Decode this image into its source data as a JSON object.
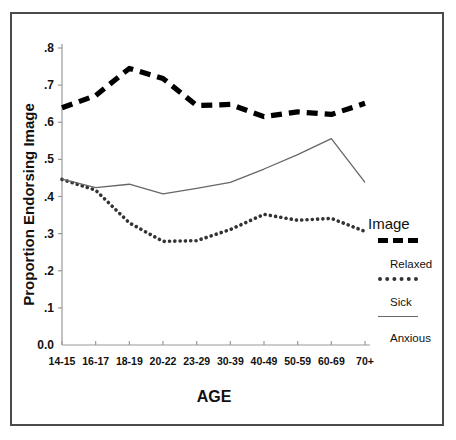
{
  "chart_data": {
    "type": "line",
    "title": "",
    "xlabel": "AGE",
    "ylabel": "Proportion Endorsing Image",
    "categories": [
      "14-15",
      "16-17",
      "18-19",
      "20-22",
      "23-29",
      "30-39",
      "40-49",
      "50-59",
      "60-69",
      "70+"
    ],
    "ylim": [
      0.0,
      0.8
    ],
    "ytick_labels": [
      "0.0",
      ".1",
      ".2",
      ".3",
      ".4",
      ".5",
      ".6",
      ".7",
      ".8"
    ],
    "ytick_values": [
      0.0,
      0.1,
      0.2,
      0.3,
      0.4,
      0.5,
      0.6,
      0.7,
      0.8
    ],
    "grid": false,
    "legend_position": "right",
    "legend_title": "Image",
    "series": [
      {
        "name": "Relaxed",
        "style": "thick-dashed",
        "color": "#000000",
        "values": [
          0.639,
          0.672,
          0.745,
          0.718,
          0.645,
          0.648,
          0.615,
          0.628,
          0.621,
          0.651
        ]
      },
      {
        "name": "Sick",
        "style": "dotted",
        "color": "#333333",
        "values": [
          0.446,
          0.417,
          0.329,
          0.279,
          0.281,
          0.311,
          0.352,
          0.336,
          0.341,
          0.306
        ]
      },
      {
        "name": "Anxious",
        "style": "thin-solid",
        "color": "#666666",
        "values": [
          0.447,
          0.424,
          0.433,
          0.407,
          0.422,
          0.438,
          0.474,
          0.513,
          0.556,
          0.438
        ]
      }
    ]
  },
  "axes": {
    "x_title": "AGE",
    "y_title": "Proportion Endorsing Image"
  },
  "legend": {
    "title": "Image",
    "entries": [
      {
        "label": "Relaxed",
        "swatch": "thick-dashed-line-icon"
      },
      {
        "label": "Sick",
        "swatch": "dotted-line-icon"
      },
      {
        "label": "Anxious",
        "swatch": "thin-solid-line-icon"
      }
    ]
  }
}
